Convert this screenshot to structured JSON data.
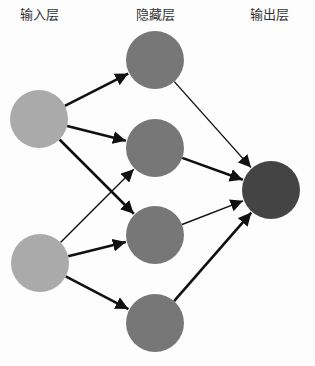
{
  "labels": {
    "input": "输入层",
    "hidden": "隐藏层",
    "output": "输出层"
  },
  "colors": {
    "input": "#aaaaaa",
    "hidden": "#777777",
    "output": "#444444",
    "edge": "#111111",
    "background": "#fdfdfd"
  },
  "nodes": [
    {
      "id": "i1",
      "layer": "input",
      "cx": 39,
      "cy": 119,
      "r": 29
    },
    {
      "id": "i2",
      "layer": "input",
      "cx": 40,
      "cy": 263,
      "r": 29
    },
    {
      "id": "h1",
      "layer": "hidden",
      "cx": 155,
      "cy": 60,
      "r": 29
    },
    {
      "id": "h2",
      "layer": "hidden",
      "cx": 155,
      "cy": 148,
      "r": 29
    },
    {
      "id": "h3",
      "layer": "hidden",
      "cx": 155,
      "cy": 235,
      "r": 29
    },
    {
      "id": "h4",
      "layer": "hidden",
      "cx": 155,
      "cy": 323,
      "r": 29
    },
    {
      "id": "o1",
      "layer": "output",
      "cx": 271,
      "cy": 190,
      "r": 29
    }
  ],
  "edges": [
    {
      "from": "i1",
      "to": "h1",
      "weight": "thick"
    },
    {
      "from": "i1",
      "to": "h2",
      "weight": "thick"
    },
    {
      "from": "i1",
      "to": "h3",
      "weight": "thick"
    },
    {
      "from": "i2",
      "to": "h2",
      "weight": "thin"
    },
    {
      "from": "i2",
      "to": "h3",
      "weight": "thick"
    },
    {
      "from": "i2",
      "to": "h4",
      "weight": "thick"
    },
    {
      "from": "h1",
      "to": "o1",
      "weight": "thin"
    },
    {
      "from": "h2",
      "to": "o1",
      "weight": "thick"
    },
    {
      "from": "h3",
      "to": "o1",
      "weight": "thin"
    },
    {
      "from": "h4",
      "to": "o1",
      "weight": "thick"
    }
  ]
}
